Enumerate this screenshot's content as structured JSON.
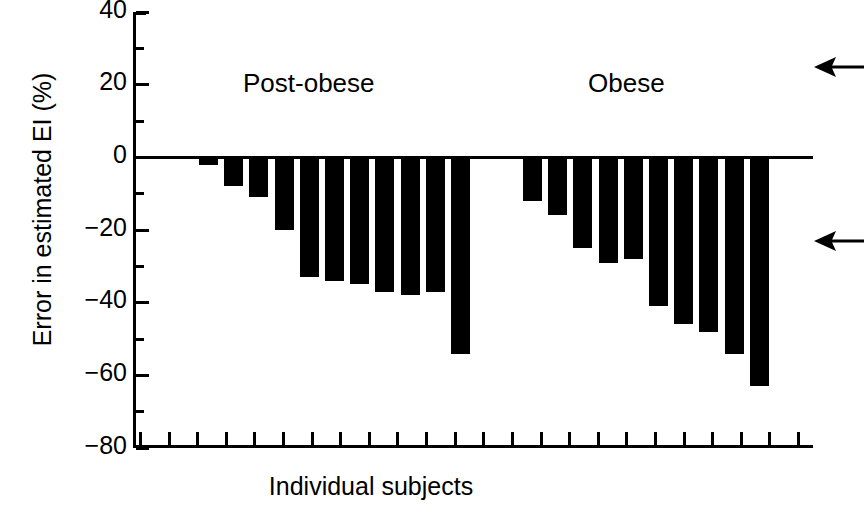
{
  "chart_data": {
    "type": "bar",
    "title": "",
    "xlabel": "Individual subjects",
    "ylabel": "Error in estimated EI (%)",
    "ylim": [
      -80,
      40
    ],
    "ytick_values": [
      40,
      20,
      0,
      -20,
      -40,
      -60,
      -80
    ],
    "ytick_labels": [
      "40",
      "20",
      "0",
      "−20",
      "−40",
      "−60",
      "−80"
    ],
    "yminor_values": [
      30,
      10,
      -10,
      -30,
      -50,
      -70
    ],
    "grid": false,
    "legend": "none",
    "bar_color": "#000000",
    "groups": [
      {
        "name": "Post-obese",
        "label": "Post-obese",
        "values": [
          -2,
          -8,
          -11,
          -20,
          -33,
          -34,
          -35,
          -37,
          -38,
          -37,
          -54
        ]
      },
      {
        "name": "Obese",
        "label": "Obese",
        "values": [
          -12,
          -16,
          -25,
          -29,
          -28,
          -41,
          -46,
          -48,
          -54,
          -63
        ]
      }
    ],
    "annotations": [
      {
        "name": "upper-arrow",
        "symbol": "←",
        "y_value": 25,
        "note": "left-pointing arrow at right margin"
      },
      {
        "name": "lower-arrow",
        "symbol": "←",
        "y_value": -23,
        "note": "left-pointing arrow at right margin"
      }
    ],
    "n_xticks": 24
  },
  "axes": {
    "y_title": "Error in estimated EI (%)",
    "x_title": "Individual subjects"
  }
}
